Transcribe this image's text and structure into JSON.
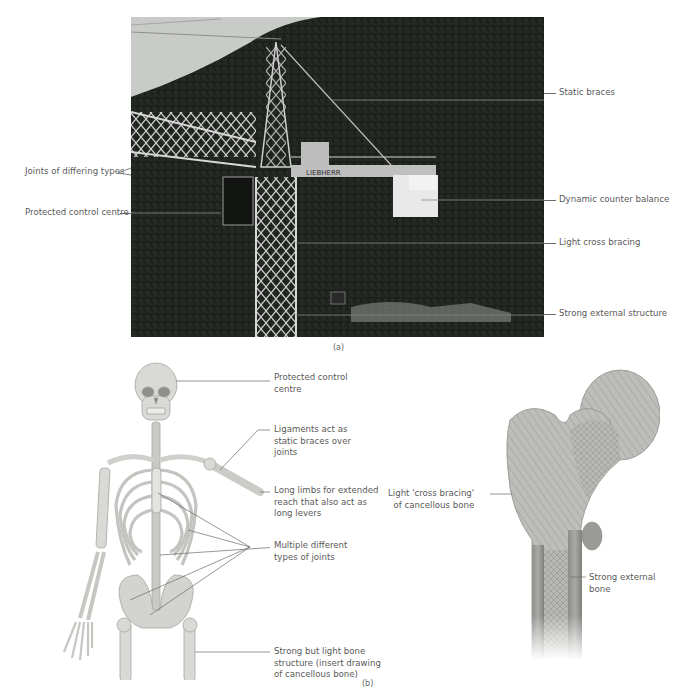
{
  "figure_a": {
    "caption": "(a)",
    "subject": "tower crane on forested hillside",
    "crane_brand_text": "LIEBHERR",
    "labels_left": [
      {
        "id": "joints",
        "text": "Joints of differing types"
      },
      {
        "id": "control",
        "text": "Protected control centre"
      }
    ],
    "labels_right": [
      {
        "id": "static",
        "text": "Static braces"
      },
      {
        "id": "counter",
        "text": "Dynamic counter balance"
      },
      {
        "id": "cross",
        "text": "Light cross bracing"
      },
      {
        "id": "external",
        "text": "Strong external structure"
      }
    ]
  },
  "figure_b": {
    "caption": "(b)",
    "skeleton_labels": [
      {
        "id": "control",
        "text": "Protected control\ncentre"
      },
      {
        "id": "ligaments",
        "text": "Ligaments act as\nstatic braces over\njoints"
      },
      {
        "id": "limbs",
        "text": "Long limbs for extended\nreach that also act as\nlong levers"
      },
      {
        "id": "joints",
        "text": "Multiple different\ntypes of joints"
      },
      {
        "id": "bone",
        "text": "Strong but light bone\nstructure (insert drawing\nof cancellous bone)"
      }
    ],
    "femur_labels": [
      {
        "id": "cancellous",
        "text": "Light 'cross bracing'\nof cancellous bone"
      },
      {
        "id": "external",
        "text": "Strong external\nbone"
      }
    ]
  },
  "colors": {
    "label_text": "#5a5a5a",
    "leader_line": "#6a6a6a",
    "bone_light": "#d6d6d3",
    "bone_shade": "#9a9a98",
    "forest": "#1f231e",
    "sky": "#c9cbc9"
  }
}
